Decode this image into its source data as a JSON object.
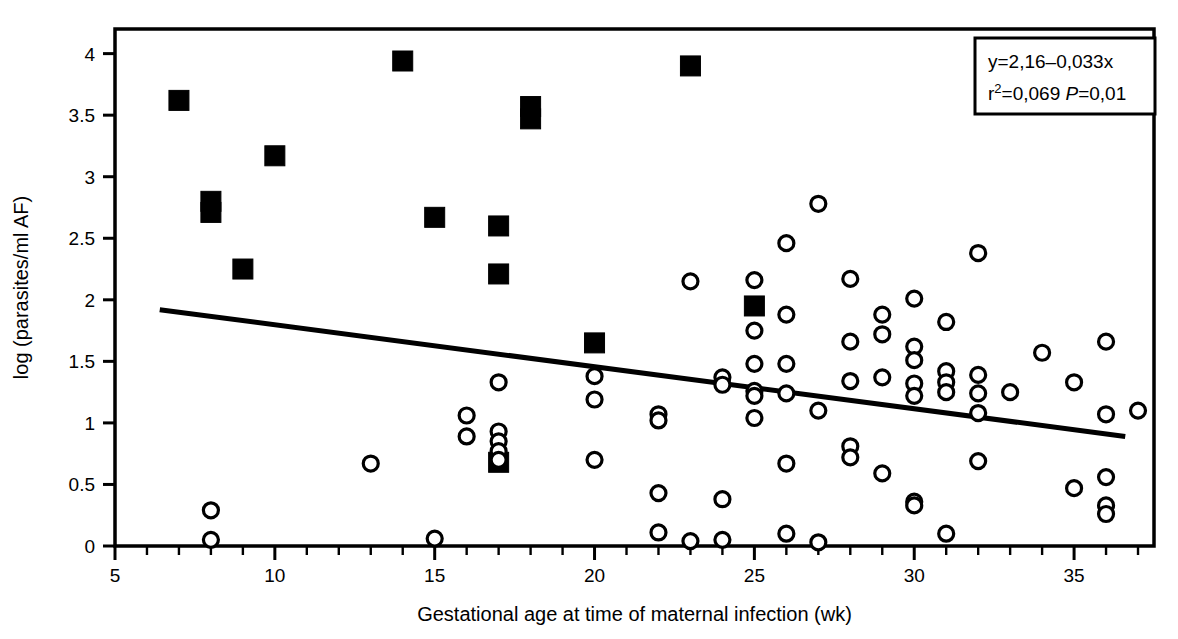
{
  "chart_data": {
    "type": "scatter",
    "title": "",
    "xlabel": "Gestational age at time of maternal infection (wk)",
    "ylabel": "log (parasites/ml AF)",
    "xlim": [
      5,
      37.5
    ],
    "ylim": [
      0,
      4.2
    ],
    "xticks": [
      5,
      10,
      15,
      20,
      25,
      30,
      35
    ],
    "xtick_labels": [
      "5",
      "10",
      "15",
      "20",
      "25",
      "30",
      "35"
    ],
    "xminor_step": 1,
    "yticks": [
      0,
      0.5,
      1,
      1.5,
      2,
      2.5,
      3,
      3.5,
      4
    ],
    "ytick_labels": [
      "0",
      "0.5",
      "1",
      "1.5",
      "2",
      "2.5",
      "3",
      "3.5",
      "4"
    ],
    "grid": false,
    "legend": "none",
    "annotation": {
      "line1": "y=2,16–0,033x",
      "line2_prefix": "r",
      "line2_sup": "2",
      "line2_mid": "=0,069 ",
      "line2_italic": "P",
      "line2_suffix": "=0,01",
      "slope": -0.033,
      "intercept": 2.16,
      "r_squared": 0.069,
      "p_value": 0.01
    },
    "regression_line": {
      "x_start": 6.4,
      "y_start": 1.92,
      "x_end": 36.6,
      "y_end": 0.89,
      "color": "#000000",
      "width": 5
    },
    "series": [
      {
        "name": "filled-square",
        "marker": "square",
        "filled": true,
        "color": "#000000",
        "points": [
          [
            7,
            3.62
          ],
          [
            8,
            2.8
          ],
          [
            8,
            2.71
          ],
          [
            9,
            2.25
          ],
          [
            10,
            3.17
          ],
          [
            14,
            3.94
          ],
          [
            15,
            2.67
          ],
          [
            17,
            2.6
          ],
          [
            17,
            2.21
          ],
          [
            17,
            0.68
          ],
          [
            18,
            3.57
          ],
          [
            18,
            3.47
          ],
          [
            20,
            1.65
          ],
          [
            23,
            3.9
          ],
          [
            25,
            1.95
          ]
        ]
      },
      {
        "name": "open-circle",
        "marker": "circle",
        "filled": false,
        "color": "#000000",
        "points": [
          [
            8,
            0.29
          ],
          [
            8,
            0.05
          ],
          [
            13,
            0.67
          ],
          [
            15,
            0.06
          ],
          [
            16,
            1.06
          ],
          [
            16,
            0.89
          ],
          [
            17,
            1.33
          ],
          [
            17,
            0.93
          ],
          [
            17,
            0.85
          ],
          [
            17,
            0.77
          ],
          [
            17,
            0.7
          ],
          [
            20,
            1.38
          ],
          [
            20,
            1.19
          ],
          [
            20,
            0.7
          ],
          [
            22,
            1.07
          ],
          [
            22,
            1.02
          ],
          [
            22,
            0.43
          ],
          [
            22,
            0.11
          ],
          [
            23,
            2.15
          ],
          [
            23,
            0.04
          ],
          [
            24,
            1.37
          ],
          [
            24,
            1.31
          ],
          [
            24,
            0.38
          ],
          [
            24,
            0.05
          ],
          [
            25,
            2.16
          ],
          [
            25,
            1.75
          ],
          [
            25,
            1.48
          ],
          [
            25,
            1.26
          ],
          [
            25,
            1.22
          ],
          [
            25,
            1.04
          ],
          [
            26,
            2.46
          ],
          [
            26,
            1.88
          ],
          [
            26,
            1.48
          ],
          [
            26,
            1.24
          ],
          [
            26,
            0.67
          ],
          [
            26,
            0.1
          ],
          [
            27,
            2.78
          ],
          [
            27,
            1.1
          ],
          [
            27,
            0.03
          ],
          [
            28,
            2.17
          ],
          [
            28,
            1.66
          ],
          [
            28,
            1.34
          ],
          [
            28,
            0.81
          ],
          [
            28,
            0.72
          ],
          [
            29,
            1.88
          ],
          [
            29,
            1.72
          ],
          [
            29,
            1.37
          ],
          [
            29,
            0.59
          ],
          [
            30,
            2.01
          ],
          [
            30,
            1.62
          ],
          [
            30,
            1.51
          ],
          [
            30,
            1.32
          ],
          [
            30,
            1.22
          ],
          [
            30,
            0.36
          ],
          [
            30,
            0.33
          ],
          [
            31,
            1.82
          ],
          [
            31,
            1.42
          ],
          [
            31,
            1.33
          ],
          [
            31,
            1.25
          ],
          [
            31,
            0.1
          ],
          [
            32,
            2.38
          ],
          [
            32,
            1.39
          ],
          [
            32,
            1.24
          ],
          [
            32,
            1.08
          ],
          [
            32,
            0.69
          ],
          [
            33,
            1.25
          ],
          [
            34,
            1.57
          ],
          [
            35,
            1.33
          ],
          [
            35,
            0.47
          ],
          [
            36,
            1.66
          ],
          [
            36,
            1.07
          ],
          [
            36,
            0.56
          ],
          [
            36,
            0.33
          ],
          [
            36,
            0.26
          ],
          [
            37,
            1.1
          ]
        ]
      }
    ]
  }
}
